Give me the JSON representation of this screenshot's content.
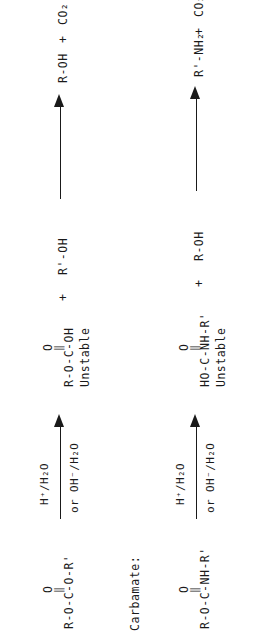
{
  "figure": {
    "orientation": "rotated-90-ccw",
    "background_color": "#ffffff",
    "ink_color": "#1a1a1a",
    "section_labels": {
      "carbamate": "Carbamate:"
    }
  },
  "reactions": [
    {
      "id": "carbonate-hydrolysis",
      "reactant": {
        "carbonyl_oxygen": "O",
        "double_bond": "‖",
        "backbone": "R-O-C-O-R'"
      },
      "arrow": {
        "label_above": "H⁺/H₂O",
        "label_below": "or OH⁻/H₂O",
        "direction": "right"
      },
      "intermediate": {
        "carbonyl_oxygen": "O",
        "double_bond": "‖",
        "backbone": "R-O-C-OH",
        "caption": "Unstable"
      },
      "intermediate_plus": "+",
      "coproduct": "R'-OH",
      "products": {
        "first": "R-OH",
        "plus": "+",
        "second": "CO₂"
      }
    },
    {
      "id": "carbamate-hydrolysis",
      "reactant": {
        "carbonyl_oxygen": "O",
        "double_bond": "‖",
        "backbone": "R-O-C-NH-R'"
      },
      "arrow": {
        "label_above": "H⁺/H₂O",
        "label_below": "or OH⁻/H₂O",
        "direction": "right"
      },
      "intermediate": {
        "carbonyl_oxygen": "O",
        "double_bond": "‖",
        "backbone": "HO-C-NH-R'",
        "caption": "Unstable"
      },
      "intermediate_plus": "+",
      "coproduct": "R-OH",
      "products": {
        "first": "R'-NH₂",
        "plus": "+",
        "second": "CO₂"
      }
    }
  ]
}
